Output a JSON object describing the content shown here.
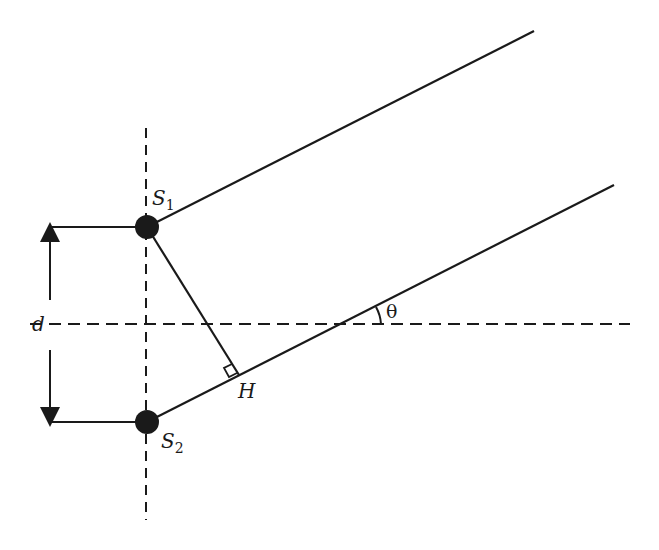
{
  "diagram": {
    "labels": {
      "source1": "S",
      "source1_sub": "1",
      "source2": "S",
      "source2_sub": "2",
      "foot": "H",
      "separation": "d",
      "angle": "θ"
    },
    "colors": {
      "ink": "#1a1a1a",
      "background": "#ffffff"
    }
  }
}
